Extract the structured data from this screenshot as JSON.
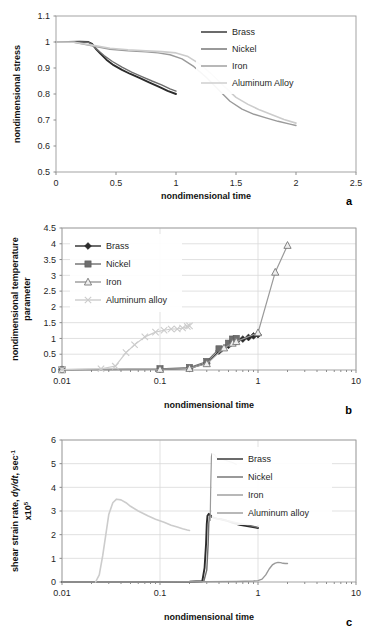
{
  "figure": {
    "title": "",
    "panels": [
      "a",
      "b",
      "c"
    ]
  },
  "colors": {
    "brass": "#2b2b2b",
    "nickel": "#6e6e6e",
    "iron": "#9a9a9a",
    "aluminum": "#cccccc",
    "axis": "#8d8d8d",
    "grid": "#d9d9d9",
    "text": "#1f1f1f"
  },
  "chart_data": [
    {
      "id": "a",
      "letter": "a",
      "type": "line",
      "title": "",
      "xlabel": "nondimensional time",
      "ylabel": "nondimensional stress",
      "xscale": "linear",
      "yscale": "linear",
      "xlim": [
        0,
        2.5
      ],
      "ylim": [
        0.5,
        1.1
      ],
      "xticks": [
        "0",
        "0.5",
        "1",
        "1.5",
        "2",
        "2.5"
      ],
      "xtickvals": [
        0,
        0.5,
        1,
        1.5,
        2,
        2.5
      ],
      "yticks": [
        "0.5",
        "0.6",
        "0.7",
        "0.8",
        "0.9",
        "1",
        "1.1"
      ],
      "ytickvals": [
        0.5,
        0.6,
        0.7,
        0.8,
        0.9,
        1.0,
        1.1
      ],
      "grid": false,
      "legend_position": "top-right",
      "legend": [
        "Brass",
        "Nickel",
        "Iron",
        "Aluminum Alloy"
      ],
      "series": [
        {
          "name": "Brass",
          "color_key": "brass",
          "width": 1.9,
          "points": [
            [
              0.0,
              1.0
            ],
            [
              0.1,
              1.0
            ],
            [
              0.2,
              1.001
            ],
            [
              0.27,
              1.0
            ],
            [
              0.3,
              0.993
            ],
            [
              0.33,
              0.975
            ],
            [
              0.37,
              0.955
            ],
            [
              0.42,
              0.932
            ],
            [
              0.48,
              0.911
            ],
            [
              0.55,
              0.893
            ],
            [
              0.62,
              0.877
            ],
            [
              0.7,
              0.861
            ],
            [
              0.78,
              0.844
            ],
            [
              0.86,
              0.827
            ],
            [
              0.93,
              0.812
            ],
            [
              1.0,
              0.8
            ]
          ]
        },
        {
          "name": "Nickel",
          "color_key": "nickel",
          "width": 1.4,
          "points": [
            [
              0.0,
              1.0
            ],
            [
              0.1,
              1.0
            ],
            [
              0.2,
              1.0
            ],
            [
              0.27,
              0.999
            ],
            [
              0.3,
              0.99
            ],
            [
              0.34,
              0.972
            ],
            [
              0.4,
              0.948
            ],
            [
              0.47,
              0.925
            ],
            [
              0.55,
              0.903
            ],
            [
              0.63,
              0.884
            ],
            [
              0.72,
              0.866
            ],
            [
              0.8,
              0.85
            ],
            [
              0.88,
              0.835
            ],
            [
              0.95,
              0.82
            ],
            [
              1.0,
              0.811
            ]
          ]
        },
        {
          "name": "Iron",
          "color_key": "iron",
          "width": 1.4,
          "points": [
            [
              0.0,
              1.0
            ],
            [
              0.15,
              0.999
            ],
            [
              0.3,
              0.985
            ],
            [
              0.45,
              0.972
            ],
            [
              0.6,
              0.966
            ],
            [
              0.75,
              0.962
            ],
            [
              0.85,
              0.958
            ],
            [
              0.95,
              0.951
            ],
            [
              1.05,
              0.935
            ],
            [
              1.15,
              0.905
            ],
            [
              1.25,
              0.865
            ],
            [
              1.35,
              0.818
            ],
            [
              1.45,
              0.772
            ],
            [
              1.55,
              0.742
            ],
            [
              1.65,
              0.722
            ],
            [
              1.75,
              0.708
            ],
            [
              1.85,
              0.695
            ],
            [
              1.95,
              0.684
            ],
            [
              2.0,
              0.679
            ]
          ]
        },
        {
          "name": "Aluminum Alloy",
          "color_key": "aluminum",
          "width": 1.6,
          "points": [
            [
              0.0,
              1.0
            ],
            [
              0.15,
              0.999
            ],
            [
              0.3,
              0.988
            ],
            [
              0.45,
              0.976
            ],
            [
              0.6,
              0.97
            ],
            [
              0.75,
              0.966
            ],
            [
              0.88,
              0.963
            ],
            [
              1.0,
              0.958
            ],
            [
              1.1,
              0.944
            ],
            [
              1.2,
              0.915
            ],
            [
              1.3,
              0.875
            ],
            [
              1.4,
              0.83
            ],
            [
              1.5,
              0.787
            ],
            [
              1.6,
              0.76
            ],
            [
              1.7,
              0.738
            ],
            [
              1.8,
              0.72
            ],
            [
              1.9,
              0.702
            ],
            [
              2.0,
              0.688
            ]
          ]
        }
      ]
    },
    {
      "id": "b",
      "letter": "b",
      "type": "line",
      "title": "",
      "xlabel": "nondimensional time",
      "ylabel": "nondimensional temperature parameter",
      "xscale": "log",
      "yscale": "linear",
      "xlim": [
        0.01,
        10
      ],
      "ylim": [
        0,
        4.5
      ],
      "xticks": [
        "0.01",
        "0.1",
        "1",
        "10"
      ],
      "xtickvals": [
        0.01,
        0.1,
        1,
        10
      ],
      "yticks": [
        "0",
        "0.5",
        "1",
        "1.5",
        "2",
        "2.5",
        "3",
        "3.5",
        "4",
        "4.5"
      ],
      "ytickvals": [
        0,
        0.5,
        1,
        1.5,
        2,
        2.5,
        3,
        3.5,
        4,
        4.5
      ],
      "grid": true,
      "legend_position": "upper-left",
      "legend": [
        "Brass",
        "Nickel",
        "Iron",
        "Aluminum alloy"
      ],
      "series": [
        {
          "name": "Brass",
          "color_key": "brass",
          "marker": "diamond",
          "width": 1.2,
          "points": [
            [
              0.01,
              0.01
            ],
            [
              0.1,
              0.02
            ],
            [
              0.2,
              0.05
            ],
            [
              0.3,
              0.22
            ],
            [
              0.4,
              0.6
            ],
            [
              0.5,
              0.78
            ],
            [
              0.6,
              0.9
            ],
            [
              0.7,
              0.98
            ],
            [
              0.8,
              1.03
            ],
            [
              0.9,
              1.08
            ],
            [
              1.0,
              1.12
            ]
          ]
        },
        {
          "name": "Nickel",
          "color_key": "nickel",
          "marker": "square",
          "width": 1.2,
          "points": [
            [
              0.01,
              0.01
            ],
            [
              0.1,
              0.04
            ],
            [
              0.2,
              0.08
            ],
            [
              0.3,
              0.27
            ],
            [
              0.4,
              0.67
            ],
            [
              0.5,
              0.85
            ],
            [
              0.55,
              0.98
            ],
            [
              0.6,
              1.0
            ]
          ]
        },
        {
          "name": "Iron",
          "color_key": "iron",
          "marker": "triangle",
          "width": 1.2,
          "points": [
            [
              0.01,
              0.01
            ],
            [
              0.1,
              0.02
            ],
            [
              0.2,
              0.05
            ],
            [
              0.3,
              0.2
            ],
            [
              0.45,
              0.7
            ],
            [
              0.55,
              0.85
            ],
            [
              0.6,
              0.9
            ],
            [
              1.0,
              1.18
            ],
            [
              1.5,
              3.1
            ],
            [
              2.0,
              3.95
            ]
          ]
        },
        {
          "name": "Aluminum alloy",
          "color_key": "aluminum",
          "marker": "x",
          "width": 1.2,
          "points": [
            [
              0.01,
              0.01
            ],
            [
              0.025,
              0.04
            ],
            [
              0.035,
              0.12
            ],
            [
              0.045,
              0.55
            ],
            [
              0.055,
              0.8
            ],
            [
              0.07,
              1.05
            ],
            [
              0.09,
              1.2
            ],
            [
              0.11,
              1.26
            ],
            [
              0.13,
              1.3
            ],
            [
              0.15,
              1.3
            ],
            [
              0.17,
              1.33
            ],
            [
              0.19,
              1.38
            ],
            [
              0.2,
              1.4
            ]
          ]
        }
      ]
    },
    {
      "id": "c",
      "letter": "c",
      "type": "line",
      "title": "",
      "xlabel": "nondimensional time",
      "ylabel_parts": [
        "shear strain rate,",
        "dγ/dt",
        ", sec",
        "-1",
        "x10",
        "5"
      ],
      "ylabel": "shear strain rate, dγ/dt, sec-1 x105",
      "xscale": "log",
      "yscale": "linear",
      "xlim": [
        0.01,
        10
      ],
      "ylim": [
        0,
        6
      ],
      "xticks": [
        "0.01",
        "0.1",
        "1",
        "10"
      ],
      "xtickvals": [
        0.01,
        0.1,
        1,
        10
      ],
      "yticks": [
        "0",
        "1",
        "2",
        "3",
        "4",
        "5",
        "6"
      ],
      "ytickvals": [
        0,
        1,
        2,
        3,
        4,
        5,
        6
      ],
      "grid": true,
      "legend_position": "upper-right",
      "legend": [
        "Brass",
        "Nickel",
        "Iron",
        "Aluminum alloy"
      ],
      "series": [
        {
          "name": "Brass",
          "color_key": "brass",
          "width": 1.9,
          "points": [
            [
              0.01,
              0.0
            ],
            [
              0.1,
              0.0
            ],
            [
              0.2,
              0.01
            ],
            [
              0.27,
              0.03
            ],
            [
              0.285,
              0.6
            ],
            [
              0.295,
              1.6
            ],
            [
              0.3,
              2.45
            ],
            [
              0.305,
              2.8
            ],
            [
              0.315,
              2.88
            ],
            [
              0.33,
              2.8
            ],
            [
              0.35,
              2.72
            ],
            [
              0.38,
              2.68
            ],
            [
              0.42,
              2.65
            ],
            [
              0.47,
              2.6
            ],
            [
              0.55,
              2.5
            ],
            [
              0.65,
              2.42
            ],
            [
              0.8,
              2.35
            ],
            [
              0.95,
              2.3
            ],
            [
              1.0,
              2.28
            ]
          ]
        },
        {
          "name": "Nickel",
          "color_key": "nickel",
          "width": 1.4,
          "points": [
            [
              0.01,
              0.0
            ],
            [
              0.1,
              0.0
            ],
            [
              0.2,
              0.01
            ],
            [
              0.28,
              0.03
            ],
            [
              0.3,
              0.5
            ],
            [
              0.31,
              1.6
            ],
            [
              0.315,
              2.5
            ],
            [
              0.32,
              2.75
            ],
            [
              0.33,
              2.78
            ],
            [
              0.35,
              2.72
            ],
            [
              0.4,
              2.66
            ],
            [
              0.5,
              2.58
            ],
            [
              0.65,
              2.48
            ],
            [
              0.8,
              2.4
            ],
            [
              0.95,
              2.33
            ],
            [
              1.0,
              2.3
            ]
          ]
        },
        {
          "name": "Iron",
          "color_key": "iron",
          "width": 1.4,
          "points": [
            [
              0.01,
              0.0
            ],
            [
              0.1,
              0.0
            ],
            [
              0.3,
              0.01
            ],
            [
              0.6,
              0.02
            ],
            [
              0.9,
              0.04
            ],
            [
              1.0,
              0.06
            ],
            [
              1.1,
              0.12
            ],
            [
              1.2,
              0.3
            ],
            [
              1.3,
              0.55
            ],
            [
              1.4,
              0.72
            ],
            [
              1.5,
              0.8
            ],
            [
              1.6,
              0.83
            ],
            [
              1.7,
              0.82
            ],
            [
              1.8,
              0.79
            ],
            [
              1.9,
              0.78
            ],
            [
              2.0,
              0.78
            ]
          ]
        },
        {
          "name": "Iron-peak",
          "color_key": "iron",
          "width": 1.2,
          "points": [
            [
              0.325,
              2.6
            ],
            [
              0.33,
              4.2
            ],
            [
              0.335,
              5.3
            ],
            [
              0.34,
              5.42
            ],
            [
              0.36,
              5.38
            ],
            [
              0.39,
              5.18
            ],
            [
              0.42,
              5.2
            ],
            [
              0.46,
              5.15
            ],
            [
              0.5,
              5.1
            ],
            [
              0.55,
              5.05
            ],
            [
              0.6,
              4.97
            ]
          ]
        },
        {
          "name": "Aluminum alloy",
          "color_key": "aluminum",
          "width": 1.6,
          "points": [
            [
              0.022,
              0.0
            ],
            [
              0.024,
              0.3
            ],
            [
              0.026,
              1.1
            ],
            [
              0.028,
              2.0
            ],
            [
              0.03,
              2.85
            ],
            [
              0.033,
              3.35
            ],
            [
              0.036,
              3.5
            ],
            [
              0.04,
              3.47
            ],
            [
              0.045,
              3.35
            ],
            [
              0.05,
              3.2
            ],
            [
              0.06,
              3.0
            ],
            [
              0.075,
              2.8
            ],
            [
              0.09,
              2.65
            ],
            [
              0.11,
              2.52
            ],
            [
              0.13,
              2.4
            ],
            [
              0.15,
              2.32
            ],
            [
              0.17,
              2.25
            ],
            [
              0.19,
              2.2
            ],
            [
              0.2,
              2.18
            ]
          ]
        }
      ]
    }
  ]
}
